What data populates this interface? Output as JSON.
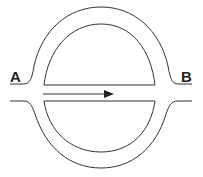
{
  "labels": {
    "left": "A",
    "right": "B"
  },
  "colors": {
    "stroke": "#333333",
    "background": "#ffffff"
  },
  "arrow": {
    "direction": "right"
  }
}
